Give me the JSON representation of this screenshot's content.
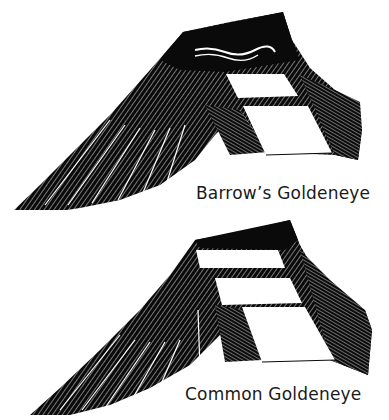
{
  "figure": {
    "panels": [
      {
        "id": "barrow",
        "caption": "Barrow’s Goldeneye"
      },
      {
        "id": "common",
        "caption": "Common Goldeneye"
      }
    ],
    "colors": {
      "ink": "#0a0a0a",
      "paper": "#ffffff",
      "hatch": "#3a3a3a"
    }
  }
}
